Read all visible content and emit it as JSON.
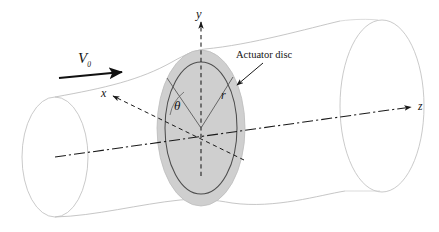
{
  "figure": {
    "background_color": "#ffffff"
  },
  "colors": {
    "disc_fill": "#cfcfcf",
    "disc_edge": "#9a9a9a",
    "inner_disc_stroke": "#4a4a4a",
    "streamtube_stroke": "#b8b8b8",
    "axis_stroke": "#1a1a1a",
    "text": "#151515",
    "velocity_arrow": "#111111"
  },
  "labels": {
    "velocity": {
      "symbol": "V",
      "subscript": "0",
      "name": "freestream-velocity"
    },
    "axis_y": "y",
    "axis_x": "x",
    "axis_z": "z",
    "theta": "θ",
    "radius": "r",
    "callout": "Actuator disc"
  },
  "geometry": {
    "disc_center_x": 201,
    "disc_center_y": 128,
    "outer_disc_rx": 44,
    "outer_disc_ry": 78,
    "inner_disc_rx": 36,
    "inner_disc_ry": 66,
    "left_cap_cx": 55,
    "left_cap_cy": 157,
    "left_cap_rx": 33,
    "left_cap_ry": 60,
    "right_cap_cx": 382,
    "right_cap_cy": 106,
    "right_cap_rx": 42,
    "right_cap_ry": 86
  },
  "annotations": {
    "flow_direction": "left-to-right",
    "y_axis_direction": "up",
    "z_axis_direction": "right-along-tube-axis",
    "x_axis_direction": "up-left-out-of-page"
  }
}
